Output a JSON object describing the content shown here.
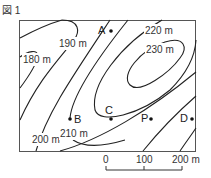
{
  "figure": {
    "label": "図 1"
  },
  "contours": [
    {
      "id": "c180",
      "label": "180 m"
    },
    {
      "id": "c190",
      "label": "190 m"
    },
    {
      "id": "c200",
      "label": "200 m"
    },
    {
      "id": "c210",
      "label": "210 m"
    },
    {
      "id": "c220",
      "label": "220 m"
    },
    {
      "id": "c230",
      "label": "230 m"
    }
  ],
  "points": [
    {
      "id": "A",
      "label": "A"
    },
    {
      "id": "B",
      "label": "B"
    },
    {
      "id": "C",
      "label": "C"
    },
    {
      "id": "P",
      "label": "P"
    },
    {
      "id": "D",
      "label": "D"
    }
  ],
  "scale": {
    "ticks": [
      "0",
      "100",
      "200 m"
    ]
  }
}
